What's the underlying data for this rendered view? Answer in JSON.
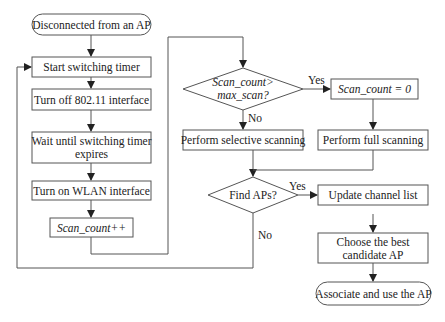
{
  "diagram": {
    "type": "flowchart",
    "nodes": {
      "start": {
        "label": "Disconnected from an AP",
        "shape": "terminal"
      },
      "start_timer": {
        "label": "Start switching timer",
        "shape": "process"
      },
      "turn_off": {
        "label": "Turn off 802.11 interface",
        "shape": "process"
      },
      "wait": {
        "line1": "Wait until switching timer",
        "line2": "expires",
        "shape": "process"
      },
      "turn_on": {
        "label": "Turn on WLAN interface",
        "shape": "process"
      },
      "scan_inc": {
        "label": "Scan_count++",
        "shape": "process"
      },
      "decision_scan": {
        "line1": "Scan_count>",
        "line2": "max_scan?",
        "shape": "decision"
      },
      "reset": {
        "label": "Scan_count = 0",
        "shape": "process"
      },
      "selective": {
        "label": "Perform selective scanning",
        "shape": "process"
      },
      "full": {
        "label": "Perform full scanning",
        "shape": "process"
      },
      "decision_find": {
        "label": "Find APs?",
        "shape": "decision"
      },
      "update": {
        "label": "Update channel list",
        "shape": "process"
      },
      "choose": {
        "line1": "Choose the best",
        "line2": "candidate AP",
        "shape": "process"
      },
      "end": {
        "label": "Associate and use the AP",
        "shape": "terminal"
      }
    },
    "edge_labels": {
      "scan_yes": "Yes",
      "scan_no": "No",
      "find_yes": "Yes",
      "find_no": "No"
    },
    "edges": [
      [
        "start",
        "start_timer"
      ],
      [
        "start_timer",
        "turn_off"
      ],
      [
        "turn_off",
        "wait"
      ],
      [
        "wait",
        "turn_on"
      ],
      [
        "turn_on",
        "scan_inc"
      ],
      [
        "scan_inc",
        "decision_scan"
      ],
      [
        "decision_scan",
        "reset",
        "Yes"
      ],
      [
        "decision_scan",
        "selective",
        "No"
      ],
      [
        "reset",
        "full"
      ],
      [
        "selective",
        "decision_find"
      ],
      [
        "full",
        "decision_find"
      ],
      [
        "decision_find",
        "update",
        "Yes"
      ],
      [
        "decision_find",
        "start_timer",
        "No"
      ],
      [
        "update",
        "choose"
      ],
      [
        "choose",
        "end"
      ]
    ]
  }
}
